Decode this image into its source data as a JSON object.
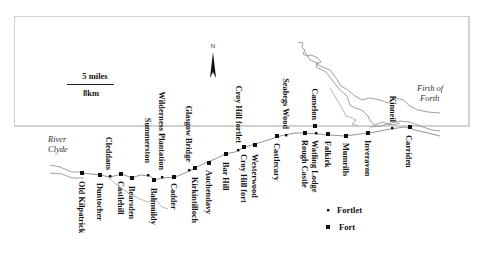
{
  "map": {
    "title": "Antonine Wall forts and fortlets",
    "north_label": "N",
    "scale": {
      "miles": "5 miles",
      "km": "8km"
    },
    "water_labels": [
      {
        "line1": "River",
        "line2": "Clyde"
      },
      {
        "line1": "Firth of",
        "line2": "Forth"
      }
    ],
    "legend": [
      {
        "symbol": "fortlet",
        "label": "Fortlet"
      },
      {
        "symbol": "fort",
        "label": "Fort"
      }
    ],
    "sites_below": [
      {
        "name": "Old Kilpatrick",
        "type": "fort"
      },
      {
        "name": "Duntocher",
        "type": "fort"
      },
      {
        "name": "Castlehill",
        "type": "fort"
      },
      {
        "name": "Bearsden",
        "type": "fort"
      },
      {
        "name": "Balmuildy",
        "type": "fort"
      },
      {
        "name": "Cadder",
        "type": "fort"
      },
      {
        "name": "Kirkintilloch",
        "type": "fort"
      },
      {
        "name": "Auchendavy",
        "type": "fort"
      },
      {
        "name": "Bar Hill",
        "type": "fort"
      },
      {
        "name": "Croy Hill fort",
        "type": "fort"
      },
      {
        "name": "Westerwood",
        "type": "fort"
      },
      {
        "name": "Castlecary",
        "type": "fort"
      },
      {
        "name": "Rough Castle",
        "type": "fort"
      },
      {
        "name": "Watling Lodge",
        "type": "fortlet"
      },
      {
        "name": "Falkirk",
        "type": "fort"
      },
      {
        "name": "Mumrills",
        "type": "fort"
      },
      {
        "name": "Inveravon",
        "type": "fort"
      },
      {
        "name": "Carriden",
        "type": "fort"
      }
    ],
    "sites_above": [
      {
        "name": "Cleddans",
        "type": "fortlet"
      },
      {
        "name": "Summerston",
        "type": "fortlet"
      },
      {
        "name": "Wilderness Plantation",
        "type": "fortlet"
      },
      {
        "name": "Glasgow Bridge",
        "type": "fortlet"
      },
      {
        "name": "Croy Hill fortlet",
        "type": "fortlet"
      },
      {
        "name": "Seabegs Wood",
        "type": "fortlet"
      },
      {
        "name": "Camelon",
        "type": "fort"
      },
      {
        "name": "Kinneil",
        "type": "fortlet"
      }
    ]
  }
}
